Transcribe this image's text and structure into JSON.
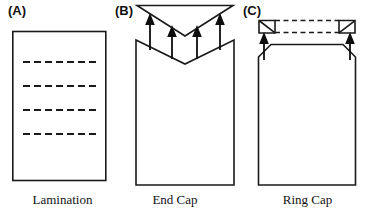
{
  "figure": {
    "background_color": "#ffffff",
    "line_color": "#1a1a1a",
    "panels": [
      {
        "label": "(A)",
        "caption": "Lamination",
        "description": "rectangular block with four horizontal dashed internal lines",
        "dashed_line_count": 4,
        "arrow_count": 0
      },
      {
        "label": "(B)",
        "caption": "End Cap",
        "description": "inverted triangular cap above a body with matching V notch, four upward arrows",
        "dashed_line_count": 0,
        "arrow_count": 4
      },
      {
        "label": "(C)",
        "caption": "Ring Cap",
        "description": "two corner wedge caps joined by dashed lines above a body with chamfered top corners, two upward arrows",
        "dashed_line_count": 2,
        "arrow_count": 2
      }
    ]
  }
}
